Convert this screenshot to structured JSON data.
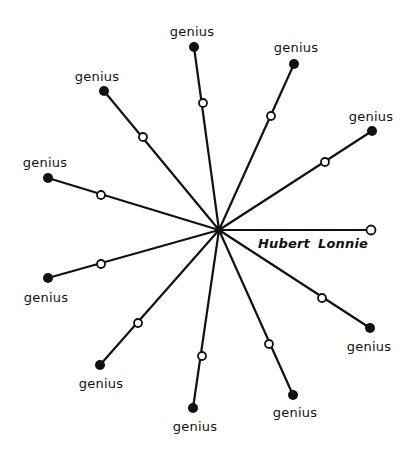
{
  "diagram": {
    "center": {
      "x": 219,
      "y": 230
    },
    "colors": {
      "ink": "#111111",
      "background": "#ffffff"
    },
    "spokes": [
      {
        "end": {
          "x": 194,
          "y": 47
        },
        "mid": {
          "x": 203,
          "y": 103
        },
        "end_marker": "filled",
        "label": "genius",
        "label_pos": {
          "x": 192,
          "y": 31
        }
      },
      {
        "end": {
          "x": 294,
          "y": 64
        },
        "mid": {
          "x": 271,
          "y": 116
        },
        "end_marker": "filled",
        "label": "genius",
        "label_pos": {
          "x": 296,
          "y": 47
        }
      },
      {
        "end": {
          "x": 372,
          "y": 131
        },
        "mid": {
          "x": 325,
          "y": 162
        },
        "end_marker": "filled",
        "label": "genius",
        "label_pos": {
          "x": 371,
          "y": 116
        }
      },
      {
        "end": {
          "x": 371,
          "y": 230
        },
        "mid": null,
        "end_marker": "open",
        "label": "",
        "label_pos": null
      },
      {
        "end": {
          "x": 370,
          "y": 328
        },
        "mid": {
          "x": 322,
          "y": 298
        },
        "end_marker": "filled",
        "label": "genius",
        "label_pos": {
          "x": 369,
          "y": 346
        }
      },
      {
        "end": {
          "x": 293,
          "y": 395
        },
        "mid": {
          "x": 269,
          "y": 344
        },
        "end_marker": "filled",
        "label": "genius",
        "label_pos": {
          "x": 295,
          "y": 412
        }
      },
      {
        "end": {
          "x": 193,
          "y": 408
        },
        "mid": {
          "x": 202,
          "y": 356
        },
        "end_marker": "filled",
        "label": "genius",
        "label_pos": {
          "x": 195,
          "y": 426
        }
      },
      {
        "end": {
          "x": 100,
          "y": 365
        },
        "mid": {
          "x": 138,
          "y": 323
        },
        "end_marker": "filled",
        "label": "genius",
        "label_pos": {
          "x": 101,
          "y": 383
        }
      },
      {
        "end": {
          "x": 48,
          "y": 278
        },
        "mid": {
          "x": 101,
          "y": 264
        },
        "end_marker": "filled",
        "label": "genius",
        "label_pos": {
          "x": 46,
          "y": 297
        }
      },
      {
        "end": {
          "x": 48,
          "y": 178
        },
        "mid": {
          "x": 101,
          "y": 195
        },
        "end_marker": "filled",
        "label": "genius",
        "label_pos": {
          "x": 45,
          "y": 162
        }
      },
      {
        "end": {
          "x": 104,
          "y": 91
        },
        "mid": {
          "x": 143,
          "y": 137
        },
        "end_marker": "filled",
        "label": "genius",
        "label_pos": {
          "x": 97,
          "y": 76
        }
      }
    ],
    "names": [
      {
        "text": "Hubert",
        "x": 284,
        "y": 243
      },
      {
        "text": "Lonnie",
        "x": 343,
        "y": 243
      }
    ]
  }
}
